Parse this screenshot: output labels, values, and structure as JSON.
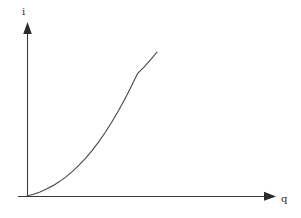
{
  "figure": {
    "background_color": "#ffffff",
    "ink_color": "#3a3a3a",
    "width": 301,
    "height": 218
  },
  "chart_data": {
    "type": "line",
    "title": "",
    "subtitle": "",
    "xlabel": "q",
    "ylabel": "i",
    "grid": false,
    "legend": null,
    "annotations": [],
    "xticks": [],
    "yticks": [],
    "xticklabels": [],
    "yticklabels": [],
    "xlim": [
      0,
      1
    ],
    "ylim": [
      0,
      1
    ],
    "axis_style": "arrow-ended open axes, origin at lower left",
    "series": [
      {
        "name": "i(q)",
        "description": "monotonically increasing convex curve rising from the origin",
        "x": [
          0.0,
          0.05,
          0.1,
          0.15,
          0.2,
          0.25,
          0.3,
          0.35,
          0.4,
          0.45,
          0.5,
          0.55,
          0.6,
          0.65,
          0.7,
          0.75,
          0.8,
          0.85,
          0.9,
          0.95,
          1.0
        ],
        "y": [
          0.0,
          0.012,
          0.028,
          0.048,
          0.072,
          0.1,
          0.133,
          0.171,
          0.214,
          0.262,
          0.315,
          0.374,
          0.439,
          0.51,
          0.587,
          0.669,
          0.757,
          0.85,
          0.895,
          0.945,
          1.0
        ]
      }
    ]
  },
  "labels": {
    "y_axis": "i",
    "x_axis": "q"
  },
  "geometry": {
    "origin_x": 27,
    "origin_y": 196,
    "y_axis_top": 22,
    "x_axis_left": 18,
    "x_axis_right": 276,
    "curve_end_x": 157,
    "curve_end_y": 52
  }
}
